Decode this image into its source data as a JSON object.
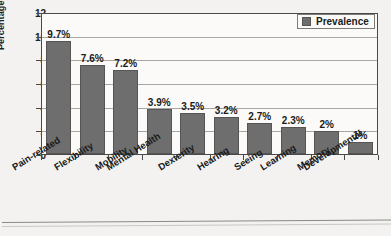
{
  "chart_data": {
    "type": "bar",
    "title": "",
    "xlabel": "",
    "ylabel": "Percentage (%)",
    "ylim": [
      0,
      12
    ],
    "yticks": [
      0,
      2,
      4,
      6,
      8,
      10,
      12
    ],
    "grid": true,
    "legend_position": "top-right",
    "legend": [
      "Prevalence"
    ],
    "categories": [
      "Pain-related",
      "Flexibility",
      "Mobility",
      "Mental Health",
      "Dexterity",
      "Hearing",
      "Seeing",
      "Learning",
      "Memory",
      "Developmental"
    ],
    "values": [
      9.7,
      7.6,
      7.2,
      3.9,
      3.5,
      3.2,
      2.7,
      2.3,
      2,
      1
    ],
    "data_labels": [
      "9.7%",
      "7.6%",
      "7.2%",
      "3.9%",
      "3.5%",
      "3.2%",
      "2.7%",
      "2.3%",
      "2%",
      "1%"
    ],
    "series": [
      {
        "name": "Prevalence",
        "values": [
          9.7,
          7.6,
          7.2,
          3.9,
          3.5,
          3.2,
          2.7,
          2.3,
          2,
          1
        ]
      }
    ]
  },
  "colors": {
    "bar_fill": "#6e6e6e",
    "bar_stroke": "#555555",
    "plot_background": "#fbfaf8",
    "page_background": "#f3f2f0",
    "gridline": "#a9a7a4",
    "axis": "#4a4a4a",
    "text": "#1a1a1a"
  }
}
